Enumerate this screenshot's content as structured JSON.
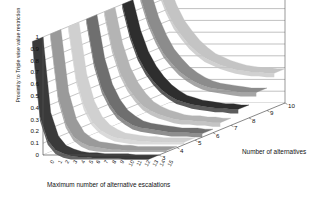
{
  "chart_data": {
    "type": "area",
    "render": "3d-surface-ribbons",
    "title": "",
    "xlabel": "Maximum number of alternative escalations",
    "ylabel": "Proximity to Triple wise value restriction",
    "zlabel": "Number of alternatives",
    "ylim": [
      0,
      1
    ],
    "yticks": [
      "1",
      "0.9",
      "0.8",
      "0.7",
      "0.6",
      "0.5",
      "0.4",
      "0.3",
      "0.2",
      "0.1",
      "0"
    ],
    "ytick_values": [
      1,
      0.9,
      0.8,
      0.7,
      0.6,
      0.5,
      0.4,
      0.3,
      0.2,
      0.1,
      0
    ],
    "xticks": [
      "0",
      "1",
      "2",
      "3",
      "4",
      "5",
      "6",
      "7",
      "8",
      "9",
      "10",
      "11",
      "12",
      "13",
      "14",
      "15"
    ],
    "zticks": [
      "3",
      "4",
      "5",
      "6",
      "7",
      "8",
      "9",
      "10"
    ],
    "grid": true,
    "legend": "none",
    "categories": [
      0,
      1,
      2,
      3,
      4,
      5,
      6,
      7,
      8,
      9,
      10,
      11,
      12,
      13,
      14,
      15
    ],
    "series": [
      {
        "name": "3",
        "color": "#3a3a3a",
        "values": [
          1.0,
          0.36,
          0.16,
          0.08,
          0.05,
          0.03,
          0.02,
          0.02,
          0.01,
          0.01,
          0.01,
          0.01,
          0.0,
          0.0,
          0.0,
          0.0
        ]
      },
      {
        "name": "4",
        "color": "#9a9a9a",
        "values": [
          1.0,
          0.47,
          0.24,
          0.13,
          0.08,
          0.05,
          0.04,
          0.03,
          0.02,
          0.02,
          0.01,
          0.01,
          0.01,
          0.01,
          0.01,
          0.01
        ]
      },
      {
        "name": "5",
        "color": "#d0d0d0",
        "values": [
          1.0,
          0.56,
          0.33,
          0.2,
          0.13,
          0.09,
          0.06,
          0.05,
          0.04,
          0.03,
          0.03,
          0.02,
          0.02,
          0.02,
          0.02,
          0.02
        ]
      },
      {
        "name": "6",
        "color": "#6f6f6f",
        "values": [
          1.0,
          0.63,
          0.41,
          0.28,
          0.19,
          0.14,
          0.1,
          0.08,
          0.07,
          0.06,
          0.05,
          0.04,
          0.04,
          0.04,
          0.03,
          0.03
        ]
      },
      {
        "name": "7",
        "color": "#b4b4b4",
        "values": [
          1.0,
          0.69,
          0.49,
          0.36,
          0.27,
          0.2,
          0.16,
          0.13,
          0.11,
          0.09,
          0.08,
          0.08,
          0.07,
          0.07,
          0.06,
          0.06
        ]
      },
      {
        "name": "8",
        "color": "#2e2e2e",
        "values": [
          1.0,
          0.74,
          0.56,
          0.44,
          0.35,
          0.28,
          0.23,
          0.19,
          0.17,
          0.15,
          0.14,
          0.13,
          0.12,
          0.12,
          0.11,
          0.11
        ]
      },
      {
        "name": "9",
        "color": "#8c8c8c",
        "values": [
          1.0,
          0.79,
          0.64,
          0.52,
          0.44,
          0.37,
          0.32,
          0.28,
          0.25,
          0.23,
          0.22,
          0.21,
          0.2,
          0.19,
          0.19,
          0.19
        ]
      },
      {
        "name": "10",
        "color": "#c4c4c4",
        "values": [
          1.0,
          0.83,
          0.7,
          0.61,
          0.53,
          0.47,
          0.42,
          0.39,
          0.36,
          0.34,
          0.32,
          0.31,
          0.3,
          0.3,
          0.29,
          0.29
        ]
      }
    ]
  },
  "axes": {
    "y_label": "Proximity to Triple wise value restriction",
    "x_label": "Maximum number of alternative escalations",
    "z_label": "Number of alternatives"
  },
  "colors": {
    "plot_background": "#ffffff",
    "grid_line": "#808080",
    "axis_line": "#555555",
    "text": "#111111"
  }
}
